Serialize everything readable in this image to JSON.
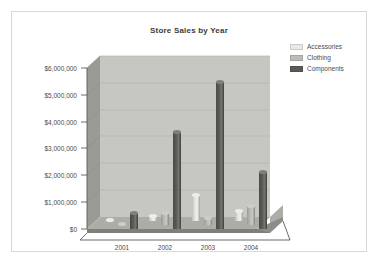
{
  "chart_data": {
    "type": "bar",
    "title": "Store Sales by Year",
    "xlabel": "",
    "ylabel": "",
    "categories": [
      "2001",
      "2002",
      "2003",
      "2004"
    ],
    "series": [
      {
        "name": "Accessories",
        "color": "#e8e8e4",
        "values": [
          20000,
          180000,
          980000,
          380000
        ]
      },
      {
        "name": "Clothing",
        "color": "#bdbdb8",
        "values": [
          15000,
          430000,
          250000,
          700000
        ]
      },
      {
        "name": "Components",
        "color": "#5a5a56",
        "values": [
          600000,
          3620000,
          5480000,
          2120000
        ]
      }
    ],
    "ylim": [
      0,
      6000000
    ],
    "y_ticks": [
      0,
      1000000,
      2000000,
      3000000,
      4000000,
      5000000,
      6000000
    ],
    "y_tick_labels": [
      "$0",
      "$1,000,000",
      "$2,000,000",
      "$3,000,000",
      "$4,000,000",
      "$5,000,000",
      "$6,000,000"
    ],
    "grid": true,
    "legend_position": "top-right",
    "three_d": true
  },
  "colors": {
    "plot_background": "#c7c7c2",
    "wall_side": "#9b9b96",
    "floor_top": "#adada8",
    "floor_side": "#7e7e7a",
    "grid_line": "#b5b5b0",
    "axis_line": "#5a5a56",
    "text": "#4a4a4a",
    "title_text": "#3b3b3b",
    "frame_border": "#d8d8d8",
    "page_background": "#ffffff"
  },
  "legend": {
    "items": [
      {
        "label": "Accessories"
      },
      {
        "label": "Clothing"
      },
      {
        "label": "Components"
      }
    ]
  }
}
